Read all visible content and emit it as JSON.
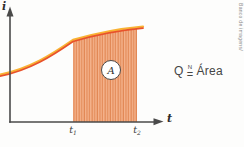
{
  "figure": {
    "axes": {
      "y_label": "i",
      "x_label": "t"
    },
    "ticks": {
      "t1": {
        "base": "t",
        "sub": "1"
      },
      "t2": {
        "base": "t",
        "sub": "2"
      }
    },
    "area_label": "A",
    "formula": {
      "lhs": "Q",
      "rel_sup": "N",
      "rel": "=",
      "rhs": "Área"
    },
    "credit": "Banco de imagens/",
    "colors": {
      "curve_top": "#F9B233",
      "curve_main": "#E8522B",
      "area_fill": "#F5B48E",
      "area_hatch": "#E08450",
      "axis": "#4A4A4A"
    }
  }
}
